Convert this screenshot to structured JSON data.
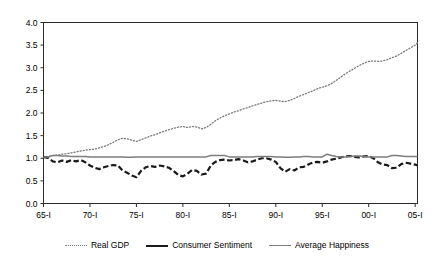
{
  "chart_data": {
    "type": "line",
    "title": "",
    "xlabel": "",
    "ylabel": "",
    "ylim": [
      0.0,
      4.0
    ],
    "ytick_step": 0.5,
    "grid": false,
    "legend_position": "bottom",
    "x_start_year": 1965,
    "x_end_year": 2005,
    "xlim": [
      1965,
      2005.25
    ],
    "yticks": [
      "0.0",
      "0.5",
      "1.0",
      "1.5",
      "2.0",
      "2.5",
      "3.0",
      "3.5",
      "4.0"
    ],
    "xticks": [
      "65-I",
      "70-I",
      "75-I",
      "80-I",
      "85-I",
      "90-I",
      "95-I",
      "00-I",
      "05-I"
    ],
    "xtick_years": [
      1965,
      1970,
      1975,
      1980,
      1985,
      1990,
      1995,
      2000,
      2005
    ],
    "series": [
      {
        "name": "Real GDP",
        "style": "dotted",
        "color": "#7a7a7a",
        "x": [
          1965,
          1965.5,
          1966,
          1966.5,
          1967,
          1967.5,
          1968,
          1968.5,
          1969,
          1969.5,
          1970,
          1970.5,
          1971,
          1971.5,
          1972,
          1972.5,
          1973,
          1973.5,
          1974,
          1974.5,
          1975,
          1975.5,
          1976,
          1976.5,
          1977,
          1977.5,
          1978,
          1978.5,
          1979,
          1979.5,
          1980,
          1980.5,
          1981,
          1981.5,
          1982,
          1982.5,
          1983,
          1983.5,
          1984,
          1984.5,
          1985,
          1985.5,
          1986,
          1986.5,
          1987,
          1987.5,
          1988,
          1988.5,
          1989,
          1989.5,
          1990,
          1990.5,
          1991,
          1991.5,
          1992,
          1992.5,
          1993,
          1993.5,
          1994,
          1994.5,
          1995,
          1995.5,
          1996,
          1996.5,
          1997,
          1997.5,
          1998,
          1998.5,
          1999,
          1999.5,
          2000,
          2000.5,
          2001,
          2001.5,
          2002,
          2002.5,
          2003,
          2003.5,
          2004,
          2004.5,
          2005,
          2005.25
        ],
        "y": [
          1.02,
          1.04,
          1.06,
          1.07,
          1.09,
          1.1,
          1.12,
          1.14,
          1.16,
          1.18,
          1.19,
          1.2,
          1.23,
          1.26,
          1.3,
          1.35,
          1.41,
          1.44,
          1.43,
          1.4,
          1.37,
          1.41,
          1.45,
          1.49,
          1.52,
          1.56,
          1.6,
          1.63,
          1.66,
          1.69,
          1.7,
          1.68,
          1.7,
          1.69,
          1.65,
          1.68,
          1.75,
          1.83,
          1.89,
          1.94,
          1.98,
          2.02,
          2.05,
          2.09,
          2.12,
          2.16,
          2.19,
          2.22,
          2.25,
          2.27,
          2.28,
          2.26,
          2.25,
          2.28,
          2.32,
          2.37,
          2.41,
          2.45,
          2.49,
          2.54,
          2.57,
          2.6,
          2.65,
          2.72,
          2.79,
          2.87,
          2.93,
          2.99,
          3.05,
          3.1,
          3.14,
          3.15,
          3.14,
          3.15,
          3.18,
          3.22,
          3.26,
          3.32,
          3.38,
          3.44,
          3.5,
          3.55
        ]
      },
      {
        "name": "Consumer Sentiment",
        "style": "dashed",
        "color": "#1a1a1a",
        "x": [
          1965,
          1965.5,
          1966,
          1966.5,
          1967,
          1967.5,
          1968,
          1968.5,
          1969,
          1969.5,
          1970,
          1970.5,
          1971,
          1971.5,
          1972,
          1972.5,
          1973,
          1973.5,
          1974,
          1974.5,
          1975,
          1975.5,
          1976,
          1976.5,
          1977,
          1977.5,
          1978,
          1978.5,
          1979,
          1979.5,
          1980,
          1980.5,
          1981,
          1981.5,
          1982,
          1982.5,
          1983,
          1983.5,
          1984,
          1984.5,
          1985,
          1985.5,
          1986,
          1986.5,
          1987,
          1987.5,
          1988,
          1988.5,
          1989,
          1989.5,
          1990,
          1990.5,
          1991,
          1991.5,
          1992,
          1992.5,
          1993,
          1993.5,
          1994,
          1994.5,
          1995,
          1995.5,
          1996,
          1996.5,
          1997,
          1997.5,
          1998,
          1998.5,
          1999,
          1999.5,
          2000,
          2000.5,
          2001,
          2001.5,
          2002,
          2002.5,
          2003,
          2003.5,
          2004,
          2004.5,
          2005,
          2005.25
        ],
        "y": [
          1.03,
          1.01,
          0.93,
          0.91,
          0.95,
          0.92,
          0.96,
          0.93,
          0.96,
          0.91,
          0.84,
          0.79,
          0.76,
          0.8,
          0.83,
          0.85,
          0.84,
          0.73,
          0.68,
          0.62,
          0.58,
          0.72,
          0.8,
          0.83,
          0.81,
          0.84,
          0.82,
          0.79,
          0.72,
          0.63,
          0.6,
          0.66,
          0.74,
          0.72,
          0.64,
          0.66,
          0.84,
          0.92,
          0.96,
          0.97,
          0.95,
          0.96,
          0.98,
          0.95,
          0.91,
          0.93,
          0.97,
          1.0,
          1.0,
          0.97,
          0.92,
          0.78,
          0.7,
          0.76,
          0.73,
          0.8,
          0.81,
          0.86,
          0.91,
          0.92,
          0.9,
          0.93,
          0.97,
          0.99,
          1.02,
          1.04,
          1.05,
          1.03,
          1.02,
          1.04,
          1.05,
          1.0,
          0.91,
          0.86,
          0.85,
          0.78,
          0.79,
          0.87,
          0.9,
          0.88,
          0.86,
          0.84
        ]
      },
      {
        "name": "Average Happiness",
        "style": "solid",
        "color": "#7d7d7d",
        "x": [
          1965,
          1965.5,
          1966,
          1966.5,
          1967,
          1967.5,
          1968,
          1968.5,
          1969,
          1969.5,
          1970,
          1970.5,
          1971,
          1971.5,
          1972,
          1972.5,
          1973,
          1973.5,
          1974,
          1974.5,
          1975,
          1975.5,
          1976,
          1976.5,
          1977,
          1977.5,
          1978,
          1978.5,
          1979,
          1979.5,
          1980,
          1980.5,
          1981,
          1981.5,
          1982,
          1982.5,
          1983,
          1983.5,
          1984,
          1984.5,
          1985,
          1985.5,
          1986,
          1986.5,
          1987,
          1987.5,
          1988,
          1988.5,
          1989,
          1989.5,
          1990,
          1990.5,
          1991,
          1991.5,
          1992,
          1992.5,
          1993,
          1993.5,
          1994,
          1994.5,
          1995,
          1995.5,
          1996,
          1996.5,
          1997,
          1997.5,
          1998,
          1998.5,
          1999,
          1999.5,
          2000,
          2000.5,
          2001,
          2001.5,
          2002,
          2002.5,
          2003,
          2003.5,
          2004,
          2004.5,
          2005,
          2005.25
        ],
        "y": [
          1.03,
          1.03,
          1.06,
          1.06,
          1.05,
          1.05,
          1.04,
          1.04,
          1.04,
          1.04,
          1.03,
          1.03,
          1.03,
          1.03,
          1.03,
          1.03,
          1.03,
          1.03,
          1.02,
          1.02,
          1.03,
          1.03,
          1.03,
          1.03,
          1.03,
          1.03,
          1.03,
          1.03,
          1.03,
          1.03,
          1.03,
          1.03,
          1.03,
          1.03,
          1.03,
          1.03,
          1.06,
          1.06,
          1.06,
          1.06,
          1.03,
          1.03,
          1.03,
          1.03,
          1.03,
          1.03,
          1.04,
          1.04,
          1.04,
          1.04,
          1.03,
          1.03,
          1.02,
          1.02,
          1.03,
          1.03,
          1.04,
          1.04,
          1.03,
          1.03,
          1.03,
          1.09,
          1.06,
          1.04,
          1.03,
          1.03,
          1.04,
          1.05,
          1.05,
          1.04,
          1.03,
          1.03,
          1.03,
          1.03,
          1.03,
          1.06,
          1.06,
          1.05,
          1.04,
          1.04,
          1.04,
          1.04
        ]
      }
    ]
  },
  "legend": {
    "items": [
      {
        "label": "Real GDP",
        "key": "dotted-line-key"
      },
      {
        "label": "Consumer Sentiment",
        "key": "dashed-line-key"
      },
      {
        "label": "Average Happiness",
        "key": "solid-line-key"
      }
    ]
  },
  "colors": {
    "axis": "#2b2b2b",
    "gdp": "#7a7a7a",
    "sentiment": "#1a1a1a",
    "happiness": "#7d7d7d",
    "background": "#ffffff"
  }
}
